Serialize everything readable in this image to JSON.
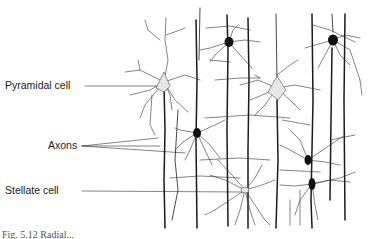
{
  "figure": {
    "type": "neuron-illustration",
    "caption": "Fig. 5.12  Radial...",
    "labels": [
      {
        "id": "pyramidal",
        "text": "Pyramidal cell",
        "x": 5,
        "y": 72
      },
      {
        "id": "axons",
        "text": "Axons",
        "x": 48,
        "y": 138
      },
      {
        "id": "stellate",
        "text": "Stellate cell",
        "x": 5,
        "y": 184
      }
    ],
    "colors": {
      "ink": "#1a1a1a",
      "light_cell_fill": "#e6e6e6",
      "dark_cell_fill": "#111111"
    }
  }
}
